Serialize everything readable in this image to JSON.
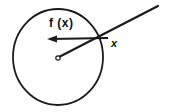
{
  "figure": {
    "background_color": "#ffffff",
    "stroke_color": "#1a1a1a",
    "width": 169,
    "height": 112,
    "labels": {
      "function_label": "f (x)",
      "point_label": "x"
    },
    "elements": {
      "circle": {
        "name": "main-circle",
        "center_x": 58,
        "center_y": 57,
        "radius_x": 45,
        "radius_y": 48,
        "stroke_width": 1.8,
        "fill": "none"
      },
      "center_dot": {
        "name": "center-open-dot",
        "cx": 58,
        "cy": 58,
        "r": 2.2,
        "fill": "#ffffff",
        "stroke_width": 1.2
      },
      "diagonal_line": {
        "name": "radial-ray",
        "x1": 59,
        "y1": 57,
        "x2": 158,
        "y2": 6,
        "stroke_width": 2.2
      },
      "force_arrow": {
        "name": "force-vector-arrow",
        "x1": 108,
        "y1": 38,
        "x2": 48,
        "y2": 39,
        "stroke_width": 2.0,
        "arrowhead_length": 9,
        "arrowhead_width": 7
      }
    }
  }
}
